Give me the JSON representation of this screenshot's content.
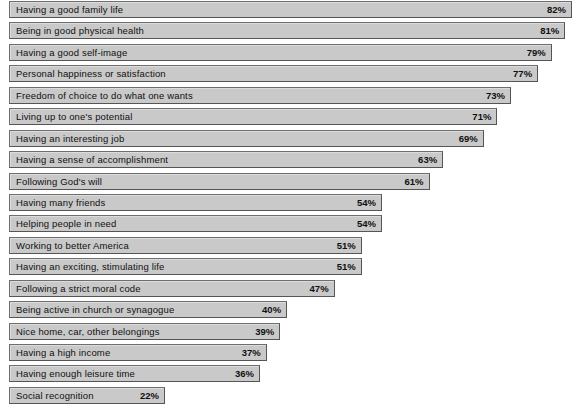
{
  "chart_data": {
    "type": "bar",
    "orientation": "horizontal",
    "title": "",
    "subtitle": "",
    "xlabel": "",
    "ylabel": "",
    "xlim": [
      0,
      100
    ],
    "grid": false,
    "legend": null,
    "value_suffix": "%",
    "value_label_position": "inside-right",
    "categories": [
      "Having a good family life",
      "Being in good physical health",
      "Having a good self-image",
      "Personal happiness or satisfaction",
      "Freedom of choice to do what one wants",
      "Living up to one's potential",
      "Having an interesting job",
      "Having a sense of accomplishment",
      "Following God's will",
      "Having many friends",
      "Helping people in need",
      "Working to better America",
      "Having an exciting, stimulating life",
      "Following a strict moral code",
      "Being active in church or synagogue",
      "Nice home, car, other belongings",
      "Having a high income",
      "Having enough leisure time",
      "Social recognition"
    ],
    "values": [
      82,
      81,
      79,
      77,
      73,
      71,
      69,
      63,
      61,
      54,
      54,
      51,
      51,
      47,
      40,
      39,
      37,
      36,
      22
    ],
    "value_labels": [
      "82%",
      "81%",
      "79%",
      "77%",
      "73%",
      "71%",
      "69%",
      "63%",
      "61%",
      "54%",
      "54%",
      "51%",
      "51%",
      "47%",
      "40%",
      "39%",
      "37%",
      "36%",
      "22%"
    ]
  },
  "style": {
    "bar_fill": "#c9c9c9",
    "bar_border": "#6e6e6e",
    "background": "#ffffff",
    "text_color": "#101010"
  }
}
